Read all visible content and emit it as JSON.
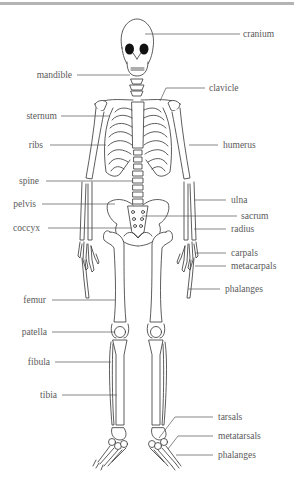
{
  "diagram": {
    "colors": {
      "line": "#555555",
      "bone_stroke": "#333333",
      "text": "#5a5a5a",
      "top_bar": "#b4b4b4"
    },
    "labels_left": [
      {
        "id": "mandible",
        "text": "mandible"
      },
      {
        "id": "sternum",
        "text": "sternum"
      },
      {
        "id": "ribs",
        "text": "ribs"
      },
      {
        "id": "spine",
        "text": "spine"
      },
      {
        "id": "pelvis",
        "text": "pelvis"
      },
      {
        "id": "coccyx",
        "text": "coccyx"
      },
      {
        "id": "femur",
        "text": "femur"
      },
      {
        "id": "patella",
        "text": "patella"
      },
      {
        "id": "fibula",
        "text": "fibula"
      },
      {
        "id": "tibia",
        "text": "tibia"
      }
    ],
    "labels_right": [
      {
        "id": "cranium",
        "text": "cranium"
      },
      {
        "id": "clavicle",
        "text": "clavicle"
      },
      {
        "id": "humerus",
        "text": "humerus"
      },
      {
        "id": "ulna",
        "text": "ulna"
      },
      {
        "id": "sacrum",
        "text": "sacrum"
      },
      {
        "id": "radius",
        "text": "radius"
      },
      {
        "id": "carpals",
        "text": "carpals"
      },
      {
        "id": "metacarpals",
        "text": "metacarpals"
      },
      {
        "id": "phalanges_hand",
        "text": "phalanges"
      },
      {
        "id": "tarsals",
        "text": "tarsals"
      },
      {
        "id": "metatarsals",
        "text": "metatarsals"
      },
      {
        "id": "phalanges_foot",
        "text": "phalanges"
      }
    ]
  }
}
